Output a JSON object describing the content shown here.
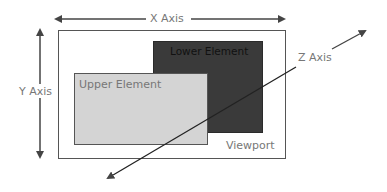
{
  "diagram": {
    "x_axis": {
      "label": "X Axis",
      "direction": "bidirectional-horizontal"
    },
    "y_axis": {
      "label": "Y Axis",
      "direction": "bidirectional-vertical"
    },
    "z_axis": {
      "label": "Z Axis",
      "direction": "bidirectional-diagonal"
    },
    "viewport": {
      "label": "Viewport"
    },
    "lower_element": {
      "label": "Lower Element",
      "fill": "#3a3a3a"
    },
    "upper_element": {
      "label": "Upper Element",
      "fill": "#d4d4d4"
    },
    "colors": {
      "axis_line": "#444444",
      "label_text": "#777777",
      "viewport_border": "#555555"
    }
  }
}
